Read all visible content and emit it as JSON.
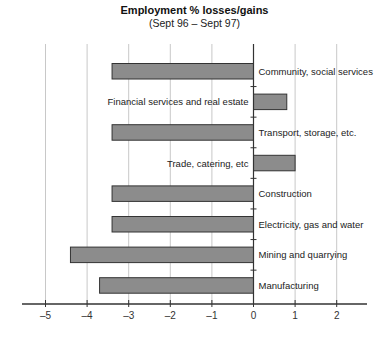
{
  "chart_data": {
    "type": "bar",
    "orientation": "horizontal",
    "title": "Employment % losses/gains",
    "subtitle": "(Sept 96 – Sept 97)",
    "xlabel": "",
    "ylabel": "",
    "xlim": [
      -5.5,
      2.7
    ],
    "xticks": [
      -5,
      -4,
      -3,
      -2,
      -1,
      0,
      1,
      2
    ],
    "xtick_labels": [
      "–5",
      "–4",
      "–3",
      "–2",
      "–1",
      "0",
      "1",
      "2"
    ],
    "grid": "vertical",
    "legend": "none",
    "categories": [
      "Community, social services",
      "Financial services and real estate",
      "Transport, storage, etc.",
      "Trade, catering, etc",
      "Construction",
      "Electricity, gas and water",
      "Mining and quarrying",
      "Manufacturing"
    ],
    "values": [
      -3.4,
      0.8,
      -3.4,
      1.0,
      -3.4,
      -3.4,
      -4.4,
      -3.7
    ],
    "colors": {
      "bar_fill": "#8c8c8c",
      "bar_stroke": "#333333",
      "grid": "#c8c8c8",
      "axis": "#333333"
    }
  }
}
